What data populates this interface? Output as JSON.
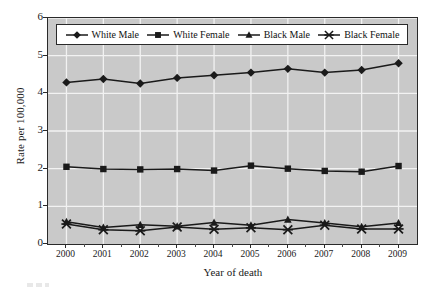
{
  "chart_data": {
    "type": "line",
    "title": "",
    "xlabel": "Year of death",
    "ylabel": "Rate per 100,000",
    "categories": [
      "2000",
      "2001",
      "2002",
      "2003",
      "2004",
      "2005",
      "2006",
      "2007",
      "2008",
      "2009"
    ],
    "xlim": [
      1999.5,
      2009.5
    ],
    "ylim": [
      0,
      6
    ],
    "yticks": [
      0,
      1,
      2,
      3,
      4,
      5,
      6
    ],
    "ytick_labels": [
      "0",
      "1",
      "2",
      "3",
      "4",
      "5",
      "6"
    ],
    "grid": true,
    "legend_position": "top-inside",
    "plot_background": "#c9c9c9",
    "series": [
      {
        "name": "White Male",
        "marker": "diamond",
        "color": "#1a1a1a",
        "values": [
          4.29,
          4.38,
          4.26,
          4.41,
          4.48,
          4.55,
          4.65,
          4.55,
          4.62,
          4.8
        ]
      },
      {
        "name": "White Female",
        "marker": "square",
        "color": "#1a1a1a",
        "values": [
          2.05,
          1.99,
          1.98,
          1.99,
          1.95,
          2.08,
          2.0,
          1.94,
          1.92,
          2.07
        ]
      },
      {
        "name": "Black Male",
        "marker": "triangle",
        "color": "#1a1a1a",
        "values": [
          0.59,
          0.44,
          0.51,
          0.47,
          0.57,
          0.5,
          0.65,
          0.56,
          0.46,
          0.56
        ]
      },
      {
        "name": "Black Female",
        "marker": "x",
        "color": "#1a1a1a",
        "values": [
          0.53,
          0.38,
          0.35,
          0.45,
          0.39,
          0.43,
          0.38,
          0.5,
          0.4,
          0.4
        ]
      }
    ]
  }
}
